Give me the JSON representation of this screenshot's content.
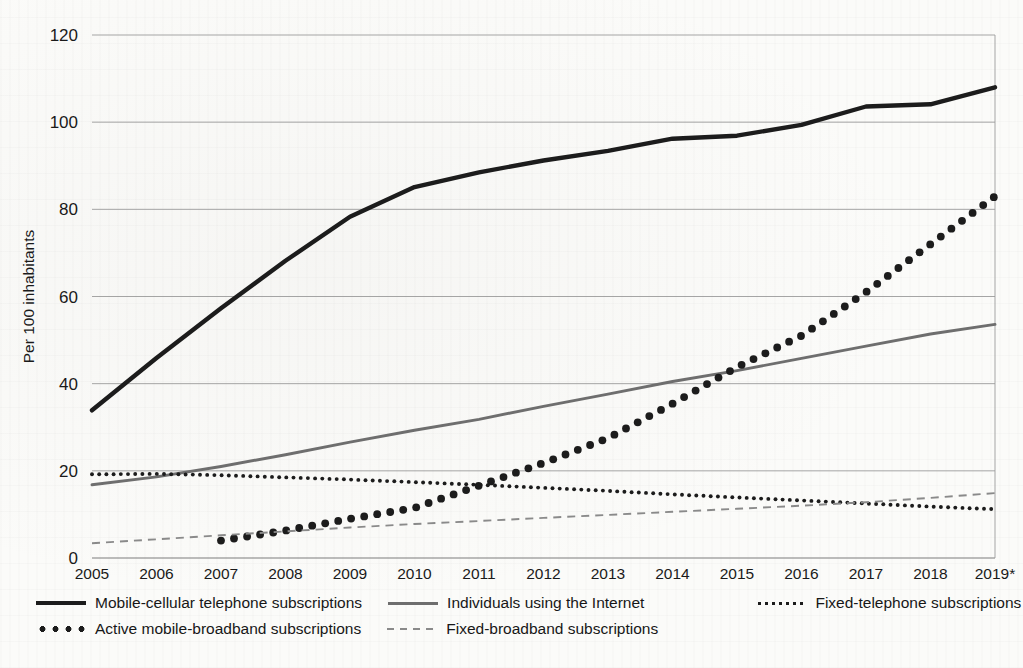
{
  "chart_data": {
    "type": "line",
    "title": "",
    "xlabel": "",
    "ylabel": "Per 100 inhabitants",
    "ylim": [
      0,
      120
    ],
    "yticks": [
      0,
      20,
      40,
      60,
      80,
      100,
      120
    ],
    "grid": true,
    "legend_position": "bottom",
    "categories": [
      "2005",
      "2006",
      "2007",
      "2008",
      "2009",
      "2010",
      "2011",
      "2012",
      "2013",
      "2014",
      "2015",
      "2016",
      "2017",
      "2018",
      "2019*"
    ],
    "series": [
      {
        "name": "Mobile-cellular telephone subscriptions",
        "style": "solid-thick",
        "color": "#1c1c1c",
        "values": [
          33.9,
          45.9,
          57.3,
          68.2,
          78.3,
          85.1,
          88.5,
          91.2,
          93.4,
          96.2,
          96.9,
          99.4,
          103.6,
          104.1,
          108.0
        ]
      },
      {
        "name": "Individuals using the Internet",
        "style": "solid-gray",
        "color": "#6e6e6e",
        "values": [
          16.8,
          18.6,
          21.0,
          23.7,
          26.6,
          29.3,
          31.8,
          34.8,
          37.6,
          40.5,
          43.0,
          45.8,
          48.6,
          51.4,
          53.6
        ]
      },
      {
        "name": "Fixed-telephone subscriptions",
        "style": "fine-dotted",
        "color": "#1c1c1c",
        "values": [
          19.2,
          19.3,
          19.0,
          18.5,
          18.0,
          17.4,
          16.8,
          16.1,
          15.4,
          14.6,
          13.9,
          13.2,
          12.5,
          11.8,
          11.2
        ]
      },
      {
        "name": "Active mobile-broadband subscriptions",
        "style": "bold-dotted",
        "color": "#1c1c1c",
        "values": [
          null,
          null,
          4.0,
          6.3,
          9.0,
          11.5,
          16.6,
          21.8,
          27.5,
          35.4,
          43.8,
          51.0,
          61.0,
          72.0,
          83.0
        ]
      },
      {
        "name": "Fixed-broadband subscriptions",
        "style": "dashed",
        "color": "#8a8a8a",
        "values": [
          3.4,
          4.3,
          5.2,
          6.1,
          7.0,
          7.8,
          8.5,
          9.2,
          9.9,
          10.6,
          11.3,
          12.0,
          12.8,
          13.8,
          14.9
        ]
      }
    ]
  },
  "legend": {
    "rows": [
      [
        {
          "label": "Mobile-cellular telephone subscriptions",
          "swatch": "sw-solid-thick",
          "icon": "solid-thick-line-icon"
        },
        {
          "label": "Individuals using the Internet",
          "swatch": "sw-solid-gray",
          "icon": "solid-gray-line-icon"
        },
        {
          "label": "Fixed-telephone subscriptions",
          "swatch": "sw-fine-dot",
          "icon": "fine-dotted-line-icon"
        }
      ],
      [
        {
          "label": "Active mobile-broadband subscriptions",
          "swatch": "sw-big-dot",
          "icon": "bold-dotted-line-icon"
        },
        {
          "label": "Fixed-broadband subscriptions",
          "swatch": "sw-dash",
          "icon": "dashed-line-icon"
        }
      ]
    ]
  }
}
